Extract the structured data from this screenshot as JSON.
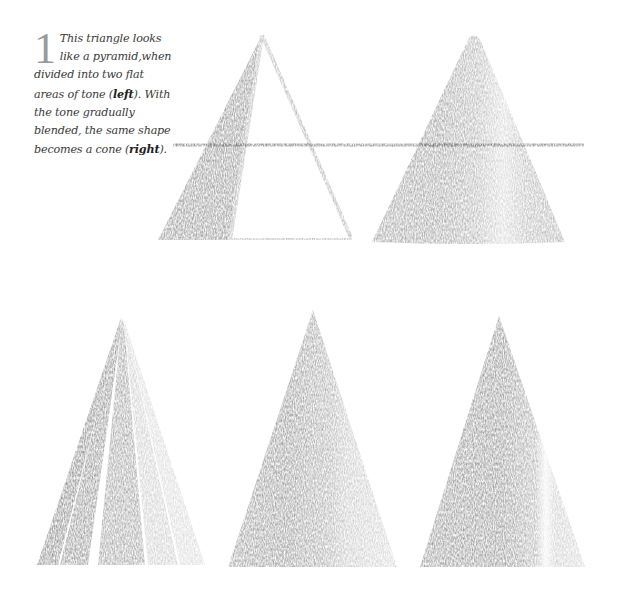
{
  "caption": {
    "step_number": "1",
    "text_before_left": "This triangle looks like a pyramid,when divided into two flat areas of tone (",
    "left_word": "left",
    "text_middle": "). With the tone gradually blended, the same shape becomes a cone (",
    "right_word": "right",
    "text_end": ")."
  },
  "illustrations": {
    "top_left": {
      "label": "flat-tone-pyramid",
      "apex": [
        262,
        35
      ],
      "base_y": 240,
      "base_x": [
        158,
        352
      ],
      "split_base_x": 230
    },
    "top_right": {
      "label": "blended-tone-cone",
      "apex": [
        474,
        36
      ],
      "base_y": 242,
      "base_x": [
        372,
        565
      ]
    },
    "horizon_line": {
      "x1": 173,
      "x2": 584,
      "y": 145
    },
    "bottom_left": {
      "label": "separated-tone-strips-cone",
      "apex": [
        122,
        315
      ],
      "base_y": 565
    },
    "bottom_middle": {
      "label": "blended-strips-cone",
      "apex": [
        313,
        310
      ],
      "base_y": 567,
      "base_x": [
        228,
        397
      ]
    },
    "bottom_right": {
      "label": "finished-shaded-cone",
      "apex": [
        499,
        316
      ],
      "base_y": 567,
      "base_x": [
        420,
        585
      ]
    }
  },
  "colors": {
    "dark_tone": "#7a7a7a",
    "mid_tone": "#9a9a9a",
    "light_tone": "#c4c4c4",
    "text": "#3a3a3a"
  }
}
